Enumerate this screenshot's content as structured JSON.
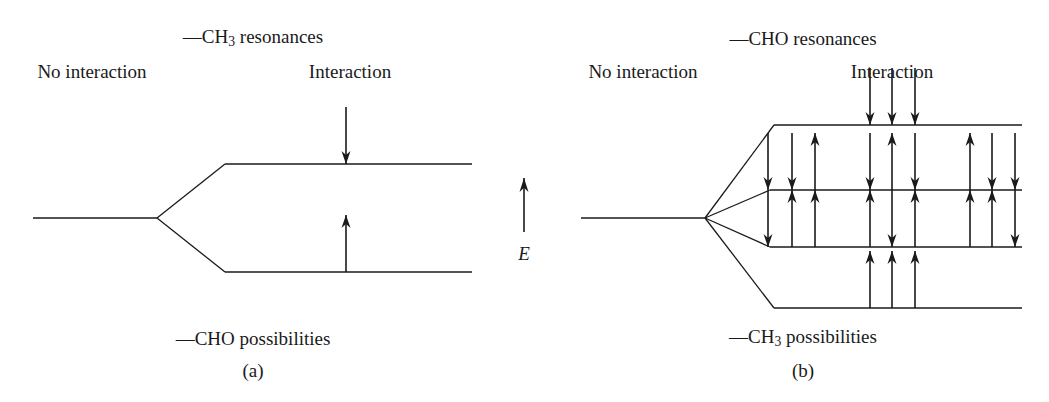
{
  "figure": {
    "width": 1049,
    "height": 402,
    "background": "#ffffff",
    "stroke_color": "#1a1a1a",
    "text_color": "#1a1a1a"
  },
  "energy_axis": {
    "label": "E",
    "direction": "up",
    "x": 524,
    "tip_y": 178,
    "tail_y": 232,
    "label_x": 524,
    "label_y": 253
  },
  "panels": [
    {
      "id": "a",
      "caption": "(a)",
      "caption_x": 253,
      "caption_y": 370,
      "top_label": "—CH₃ resonances",
      "top_label_text": "CH3 resonances",
      "top_label_x": 253,
      "top_label_y": 38,
      "bottom_label": "—CHO possibilities",
      "bottom_label_text": "CHO possibilities",
      "bottom_label_x": 253,
      "bottom_label_y": 338,
      "left_header": "No interaction",
      "left_header_x": 92,
      "left_header_y": 71,
      "right_header": "Interaction",
      "right_header_x": 350,
      "right_header_y": 71,
      "unsplit_line": {
        "x1": 33,
        "y1": 218,
        "x2": 157,
        "y2": 218
      },
      "levels": [
        {
          "name": "upper-level",
          "y": 164,
          "branch_from_x": 157,
          "branch_from_y": 218,
          "branch_to_x": 225,
          "line_x1": 225,
          "line_x2": 472,
          "arrows": [
            {
              "x": 346,
              "dir": "down"
            }
          ]
        },
        {
          "name": "lower-level",
          "y": 272,
          "branch_from_x": 157,
          "branch_from_y": 218,
          "branch_to_x": 225,
          "line_x1": 225,
          "line_x2": 472,
          "arrows": [
            {
              "x": 346,
              "dir": "up"
            }
          ]
        }
      ]
    },
    {
      "id": "b",
      "caption": "(b)",
      "caption_x": 803,
      "caption_y": 370,
      "top_label": "—CHO resonances",
      "top_label_text": "CHO resonances",
      "top_label_x": 803,
      "top_label_y": 38,
      "bottom_label": "—CH₃ possibilities",
      "bottom_label_text": "CH3 possibilities",
      "bottom_label_x": 803,
      "bottom_label_y": 338,
      "left_header": "No interaction",
      "left_header_x": 643,
      "left_header_y": 71,
      "right_header": "Interaction",
      "right_header_x": 892,
      "right_header_y": 71,
      "unsplit_line": {
        "x1": 581,
        "y1": 218,
        "x2": 705,
        "y2": 218
      },
      "levels": [
        {
          "name": "level-1",
          "y": 125,
          "branch_from_x": 705,
          "branch_from_y": 218,
          "branch_to_x": 774,
          "line_x1": 774,
          "line_x2": 1022,
          "arrows": [
            {
              "x": 870,
              "dir": "down"
            },
            {
              "x": 892,
              "dir": "down"
            },
            {
              "x": 915,
              "dir": "down"
            }
          ]
        },
        {
          "name": "level-2",
          "y": 190,
          "branch_from_x": 705,
          "branch_from_y": 218,
          "branch_to_x": 770,
          "line_x1": 770,
          "line_x2": 1022,
          "arrows": [
            {
              "x": 768,
              "dir": "down"
            },
            {
              "x": 792,
              "dir": "down"
            },
            {
              "x": 815,
              "dir": "up"
            },
            {
              "x": 870,
              "dir": "down"
            },
            {
              "x": 892,
              "dir": "up"
            },
            {
              "x": 915,
              "dir": "down"
            },
            {
              "x": 970,
              "dir": "up"
            },
            {
              "x": 992,
              "dir": "down"
            },
            {
              "x": 1015,
              "dir": "down"
            }
          ]
        },
        {
          "name": "level-3",
          "y": 247,
          "branch_from_x": 705,
          "branch_from_y": 218,
          "branch_to_x": 770,
          "line_x1": 770,
          "line_x2": 1022,
          "arrows": [
            {
              "x": 768,
              "dir": "down"
            },
            {
              "x": 792,
              "dir": "up"
            },
            {
              "x": 815,
              "dir": "up"
            },
            {
              "x": 870,
              "dir": "up"
            },
            {
              "x": 892,
              "dir": "down"
            },
            {
              "x": 915,
              "dir": "up"
            },
            {
              "x": 970,
              "dir": "up"
            },
            {
              "x": 992,
              "dir": "up"
            },
            {
              "x": 1015,
              "dir": "down"
            }
          ]
        },
        {
          "name": "level-4",
          "y": 308,
          "branch_from_x": 705,
          "branch_from_y": 218,
          "branch_to_x": 774,
          "line_x1": 774,
          "line_x2": 1022,
          "arrows": [
            {
              "x": 870,
              "dir": "up"
            },
            {
              "x": 892,
              "dir": "up"
            },
            {
              "x": 915,
              "dir": "up"
            }
          ]
        }
      ]
    }
  ],
  "arrow_geometry": {
    "length": 57,
    "head_width": 9,
    "head_length": 13,
    "stroke_width": 1.6
  }
}
